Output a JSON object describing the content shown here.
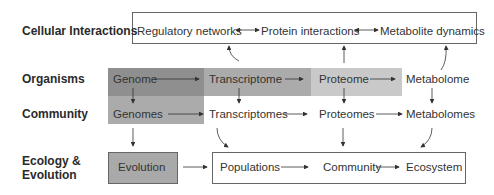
{
  "rows": {
    "cellular": "Cellular Interactions",
    "organisms": "Organisms",
    "community": "Community",
    "ecology_line1": "Ecology &",
    "ecology_line2": "Evolution"
  },
  "cellular_nodes": [
    "Regulatory networks",
    "Protein interactions",
    "Metabolite dynamics"
  ],
  "organism_nodes": [
    "Genome",
    "Transcriptome",
    "Proteome",
    "Metabolome"
  ],
  "community_nodes": [
    "Genomes",
    "Transcriptomes",
    "Proteomes",
    "Metabolomes"
  ],
  "ecology_nodes": [
    "Evolution",
    "Populations",
    "Community",
    "Ecosystem"
  ],
  "colors": {
    "genome_fill": "#8f8f8f",
    "transcriptome_fill": "#ababab",
    "proteome_fill": "#c9c9c9",
    "genomes_fill": "#ababab",
    "evolution_fill": "#a9a9a9",
    "border": "#555555",
    "arrow": "#333333"
  }
}
